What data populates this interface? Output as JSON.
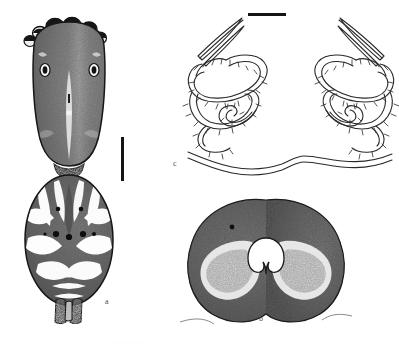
{
  "figure": {
    "type": "scientific-plate",
    "background_color": "#ffffff",
    "ink_color": "#1a1a1a",
    "width": 399,
    "height": 349
  },
  "panels": [
    {
      "id": "a",
      "label": "a",
      "name": "dorsal-habitus",
      "description": "Dorsal view of spider body: stippled cephalothorax with eight eyes along anterior margin, and ovoid abdomen bearing pale folium pattern, sigilla and posterior spinnerets",
      "label_x": 105,
      "label_y": 298
    },
    {
      "id": "b",
      "label": "b",
      "name": "epigyne-ventral",
      "description": "Heavily stippled bilobed epigynal plate with median pale notch",
      "label_x": 259,
      "label_y": 315
    },
    {
      "id": "c",
      "label": "c",
      "name": "internal-genitalia",
      "description": "Line drawing of paired coiled and annulated spermathecal ducts with elongate tapering apical projections",
      "label_x": 173,
      "label_y": 160
    }
  ],
  "scale_bars": [
    {
      "name": "scale-bar-vertical",
      "orientation": "vertical",
      "x": 121,
      "y": 137,
      "length": 44,
      "thickness": 3,
      "color": "#141414"
    },
    {
      "name": "scale-bar-horizontal",
      "orientation": "horizontal",
      "x": 248,
      "y": 13,
      "length": 38,
      "thickness": 3,
      "color": "#141414"
    }
  ],
  "eyes": {
    "name": "anterior-eye-row",
    "count": 8
  },
  "caption": {
    "text": ". . . . . . . . . . .",
    "visible": "partial"
  }
}
